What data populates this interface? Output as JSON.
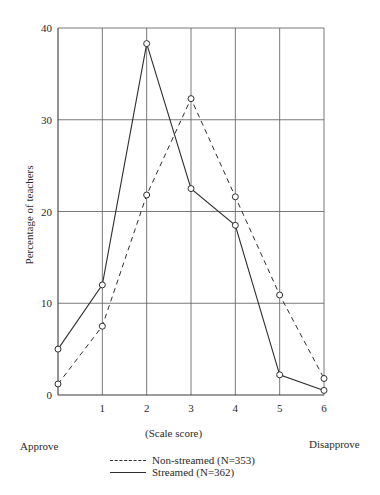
{
  "chart_data": {
    "type": "line",
    "title": "",
    "xlabel": "(Scale score)",
    "ylabel": "Percentage of teachers",
    "x": [
      0,
      1,
      2,
      3,
      4,
      5,
      6
    ],
    "x_tick_labels": [
      "1",
      "2",
      "3",
      "4",
      "5",
      "6"
    ],
    "y_tick_labels": [
      "0",
      "10",
      "20",
      "30",
      "40"
    ],
    "y_ticks": [
      0,
      10,
      20,
      30,
      40
    ],
    "xlim": [
      0,
      6
    ],
    "ylim": [
      0,
      40
    ],
    "grid": true,
    "x_end_labels": {
      "left": "Approve",
      "right": "Disapprove"
    },
    "series": [
      {
        "name": "Non-streamed (N=353)",
        "style": "dashed",
        "marker": "open-circle",
        "values": [
          1.2,
          7.5,
          21.8,
          32.3,
          21.6,
          10.9,
          1.8
        ]
      },
      {
        "name": "Streamed (N=362)",
        "style": "solid",
        "marker": "open-circle",
        "values": [
          5.0,
          12.0,
          38.3,
          22.5,
          18.5,
          2.2,
          0.5
        ]
      }
    ],
    "legend_position": "bottom-center"
  },
  "legend": {
    "non_streamed": "Non-streamed (N=353)",
    "streamed": "Streamed (N=362)"
  },
  "labels": {
    "xlabel": "(Scale score)",
    "ylabel": "Percentage of teachers",
    "approve": "Approve",
    "disapprove": "Disapprove"
  }
}
